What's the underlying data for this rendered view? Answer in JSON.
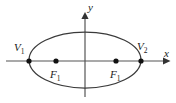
{
  "figure": {
    "type": "ellipse-conic-diagram",
    "background_color": "#ffffff",
    "stroke_color": "#3a3a3a",
    "axis_color": "#555555",
    "label_color": "#1a1a1a",
    "axes": {
      "x_label": "x",
      "y_label": "y",
      "x_axis": {
        "x_start": 6,
        "x_end": 170,
        "y": 61
      },
      "y_axis": {
        "y_start": 14,
        "y_end": 97,
        "x": 85
      },
      "origin": {
        "x": 85,
        "y": 61
      }
    },
    "ellipse": {
      "center_x": 85,
      "center_y": 60,
      "semi_major_a": 56,
      "semi_minor_b": 28
    },
    "vertices": [
      {
        "name": "left-vertex",
        "label": "V",
        "subscript": "1",
        "x": 29,
        "y": 61,
        "label_x": 17,
        "label_y": 49
      },
      {
        "name": "right-vertex",
        "label": "V",
        "subscript": "2",
        "x": 141,
        "y": 61,
        "label_x": 139,
        "label_y": 48
      }
    ],
    "foci": [
      {
        "name": "left-focus",
        "label": "F",
        "subscript": "1",
        "x": 56,
        "y": 61,
        "label_x": 50,
        "label_y": 77
      },
      {
        "name": "right-focus",
        "label": "F",
        "subscript": "1",
        "x": 116,
        "y": 61,
        "label_x": 110,
        "label_y": 77
      }
    ]
  }
}
